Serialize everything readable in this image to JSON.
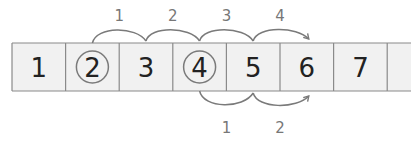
{
  "colors": {
    "cell_fill": "#f1f1f1",
    "cell_border": "#8a8a8a",
    "digit": "#222222",
    "arrow": "#7a7a7a",
    "jump_label": "#777777"
  },
  "track": {
    "cells": [
      "1",
      "2",
      "3",
      "4",
      "5",
      "6",
      "7",
      ""
    ],
    "circled": [
      "2",
      "4"
    ],
    "open_ended_right": true
  },
  "top_jumps": {
    "start": "2",
    "end": "6",
    "labels": [
      "1",
      "2",
      "3",
      "4"
    ]
  },
  "bottom_jumps": {
    "start": "4",
    "end": "6",
    "labels": [
      "1",
      "2"
    ]
  }
}
